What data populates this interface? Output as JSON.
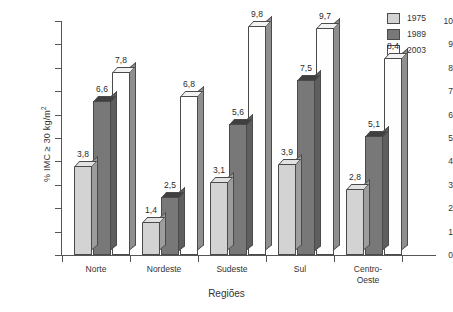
{
  "chart_data": {
    "type": "bar",
    "title": "",
    "xlabel": "Regiões",
    "ylabel": "% IMC ≥ 30 kg/m",
    "ylabel_sup": "2",
    "categories": [
      "Norte",
      "Nordeste",
      "Sudeste",
      "Sul",
      "Centro-Oeste"
    ],
    "category_lines": [
      [
        "Norte"
      ],
      [
        "Nordeste"
      ],
      [
        "Sudeste"
      ],
      [
        "Sul"
      ],
      [
        "Centro-",
        "Oeste"
      ]
    ],
    "series": [
      {
        "name": "1975",
        "color": "#d3d3d3",
        "values": [
          3.8,
          1.4,
          3.1,
          3.9,
          2.8
        ],
        "labels": [
          "3,8",
          "1,4",
          "3,1",
          "3,9",
          "2,8"
        ]
      },
      {
        "name": "1989",
        "color": "#787878",
        "values": [
          6.6,
          2.5,
          5.6,
          7.5,
          5.1
        ],
        "labels": [
          "6,6",
          "2,5",
          "5,6",
          "7,5",
          "5,1"
        ]
      },
      {
        "name": "2003",
        "color": "#fefefe",
        "values": [
          7.8,
          6.8,
          9.8,
          9.7,
          8.4
        ],
        "labels": [
          "7,8",
          "6,8",
          "9,8",
          "9,7",
          "8,4"
        ]
      }
    ],
    "ylim": [
      0,
      10
    ],
    "yticks": [
      0,
      1,
      2,
      3,
      4,
      5,
      6,
      7,
      8,
      9,
      10
    ],
    "ytick_labels": [
      "0",
      "1",
      "2",
      "3",
      "4",
      "5",
      "6",
      "7",
      "8",
      "9",
      "10"
    ],
    "grid": false,
    "legend_position": "top-right",
    "legend_entries": [
      "1975",
      "1989",
      "2003"
    ],
    "decimal_separator": ","
  }
}
